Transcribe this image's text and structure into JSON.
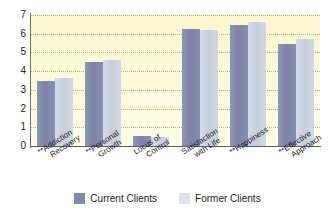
{
  "chart_data": {
    "type": "bar",
    "title": "",
    "xlabel": "",
    "ylabel": "",
    "ylim": [
      0,
      7
    ],
    "yticks": [
      0,
      1,
      2,
      3,
      4,
      5,
      6,
      7
    ],
    "grid": true,
    "legend_position": "bottom",
    "categories": [
      "**Addiction Recovery",
      "**Personal Growth",
      "Locus of Control",
      "Satisfaction with Life",
      "**Happiness",
      "**Effective Approach"
    ],
    "category_lines": [
      [
        "**Addiction",
        "Recovery"
      ],
      [
        "**Personal",
        "Growth"
      ],
      [
        "Locus of",
        "Control"
      ],
      [
        "Satisfaction",
        "with Life"
      ],
      [
        "**Happiness",
        ""
      ],
      [
        "**Effective",
        "Approach"
      ]
    ],
    "series": [
      {
        "name": "Current Clients",
        "color": "#8289ab",
        "values": [
          3.5,
          4.5,
          0.55,
          6.25,
          6.45,
          5.45
        ]
      },
      {
        "name": "Former Clients",
        "color": "#ccd3e0",
        "values": [
          3.65,
          4.6,
          0.5,
          6.2,
          6.65,
          5.7
        ]
      }
    ],
    "plot_background": "#fbf8d8",
    "gridline_color": "#b9a94e"
  },
  "legend": {
    "items": [
      {
        "label": "Current Clients",
        "swatch": "current"
      },
      {
        "label": "Former Clients",
        "swatch": "former"
      }
    ]
  }
}
